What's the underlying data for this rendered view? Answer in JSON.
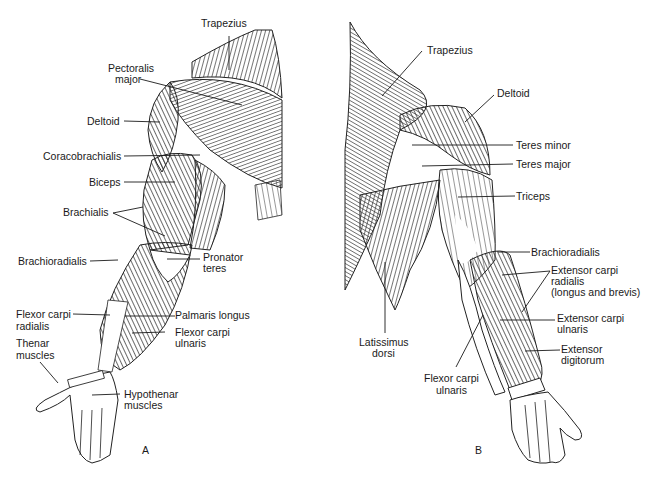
{
  "figure": {
    "panels": [
      {
        "id": "A",
        "letter": "A",
        "view": "anterior",
        "labels": {
          "trapezius": "Trapezius",
          "pectoralis_1": "Pectoralis",
          "pectoralis_2": "major",
          "deltoid": "Deltoid",
          "coracobrachialis": "Coracobrachialis",
          "biceps": "Biceps",
          "brachialis": "Brachialis",
          "brachioradialis": "Brachioradialis",
          "pronator_1": "Pronator",
          "pronator_2": "teres",
          "fcr_1": "Flexor carpi",
          "fcr_2": "radialis",
          "palmaris": "Palmaris longus",
          "fcu_1": "Flexor carpi",
          "fcu_2": "ulnaris",
          "thenar_1": "Thenar",
          "thenar_2": "muscles",
          "hypothenar_1": "Hypothenar",
          "hypothenar_2": "muscles"
        }
      },
      {
        "id": "B",
        "letter": "B",
        "view": "posterior",
        "labels": {
          "trapezius": "Trapezius",
          "deltoid": "Deltoid",
          "teres_minor": "Teres minor",
          "teres_major": "Teres major",
          "triceps": "Triceps",
          "brachioradialis": "Brachioradialis",
          "ecr_1": "Extensor carpi",
          "ecr_2": "radialis",
          "ecr_3": "(longus and brevis)",
          "ecu_1": "Extensor carpi",
          "ecu_2": "ulnaris",
          "ed_1": "Extensor",
          "ed_2": "digitorum",
          "lat_1": "Latissimus",
          "lat_2": "dorsi",
          "fcu_1": "Flexor carpi",
          "fcu_2": "ulnaris"
        }
      }
    ]
  },
  "colors": {
    "ink": "#1a1a1a",
    "paper": "#ffffff",
    "hatch": "#3a3a3a"
  }
}
